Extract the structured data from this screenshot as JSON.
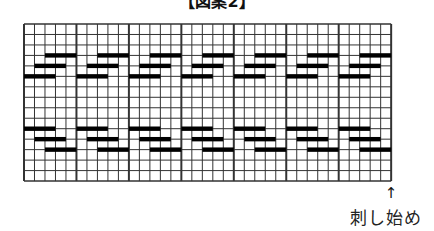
{
  "title": "【図案2】",
  "grid": {
    "columns": 35,
    "rows": 15,
    "major_every": 5,
    "origin_x": 24,
    "origin_y": 24,
    "cell_w": 10.49,
    "cell_h": 10.47,
    "line_color": "#333333",
    "bar_color": "#000000"
  },
  "motif": {
    "repeat_columns": 5,
    "repeats": 7,
    "bars": [
      {
        "line": 3,
        "from": 2,
        "to": 5
      },
      {
        "line": 4,
        "from": 1,
        "to": 4
      },
      {
        "line": 5,
        "from": 0,
        "to": 3
      },
      {
        "line": 10,
        "from": 0,
        "to": 3
      },
      {
        "line": 11,
        "from": 1,
        "to": 4
      },
      {
        "line": 12,
        "from": 2,
        "to": 5
      }
    ]
  },
  "start_marker": {
    "arrow": "↑",
    "label": "刺し始め"
  }
}
